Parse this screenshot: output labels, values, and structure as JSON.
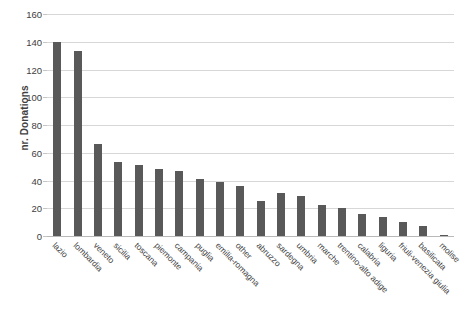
{
  "chart_data": {
    "type": "bar",
    "title": "",
    "xlabel": "",
    "ylabel": "nr. Donations",
    "ylim": [
      0,
      160
    ],
    "yticks": [
      0,
      20,
      40,
      60,
      80,
      100,
      120,
      140,
      160
    ],
    "grid": true,
    "legend": false,
    "bar_color": "#595959",
    "gridline_color": "#d7d7d7",
    "categories": [
      "lazio",
      "lombardia",
      "veneto",
      "sicilia",
      "toscana",
      "piemonte",
      "campania",
      "puglia",
      "emilia-romagna",
      "other",
      "abruzzo",
      "sardegna",
      "umbria",
      "marche",
      "trentino-alto adige",
      "calabria",
      "liguria",
      "friuli-venezia giulia",
      "basilicata",
      "molise"
    ],
    "values": [
      140,
      133,
      66,
      53,
      51,
      48,
      47,
      41,
      39,
      36,
      25,
      31,
      29,
      22,
      20,
      16,
      14,
      10,
      7,
      1
    ]
  }
}
